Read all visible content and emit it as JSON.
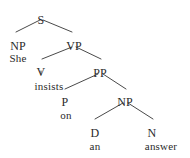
{
  "figure": {
    "kind": "constituency-syntax-tree",
    "sentence": "She insists on an answer",
    "ink_color": "#2b2b2b",
    "line_color": "#4a4a4a",
    "background_color": "#ffffff"
  },
  "nodes": {
    "s": {
      "label": "S",
      "x": 41,
      "y": 14
    },
    "np_subject": {
      "label": "NP",
      "x": 18,
      "y": 40
    },
    "vp": {
      "label": "VP",
      "x": 74,
      "y": 40
    },
    "v": {
      "label": "V",
      "x": 41,
      "y": 66
    },
    "pp": {
      "label": "PP",
      "x": 100,
      "y": 67
    },
    "p": {
      "label": "P",
      "x": 65,
      "y": 96
    },
    "np_object": {
      "label": "NP",
      "x": 125,
      "y": 96
    },
    "d": {
      "label": "D",
      "x": 95,
      "y": 127
    },
    "n": {
      "label": "N",
      "x": 152,
      "y": 127
    }
  },
  "leaves": {
    "she": {
      "label": "She",
      "x": 18,
      "y": 53
    },
    "insists": {
      "label": "insists",
      "x": 49,
      "y": 81
    },
    "on": {
      "label": "on",
      "x": 66,
      "y": 110
    },
    "an": {
      "label": "an",
      "x": 95,
      "y": 141
    },
    "answer": {
      "label": "answer",
      "x": 161,
      "y": 141
    }
  },
  "branches": [
    {
      "name": "s-to-np-subject",
      "x1": 40,
      "y1": 20,
      "x2": 16,
      "y2": 32
    },
    {
      "name": "s-to-vp",
      "x1": 43,
      "y1": 20,
      "x2": 72,
      "y2": 32
    },
    {
      "name": "vp-to-v",
      "x1": 72,
      "y1": 47,
      "x2": 42,
      "y2": 59
    },
    {
      "name": "vp-to-pp",
      "x1": 76,
      "y1": 47,
      "x2": 101,
      "y2": 59
    },
    {
      "name": "v-to-insists",
      "x1": 41,
      "y1": 71,
      "x2": 41,
      "y2": 74
    },
    {
      "name": "pp-to-p",
      "x1": 98,
      "y1": 74,
      "x2": 65,
      "y2": 89
    },
    {
      "name": "pp-to-np-object",
      "x1": 103,
      "y1": 74,
      "x2": 126,
      "y2": 89
    },
    {
      "name": "np-object-to-d",
      "x1": 123,
      "y1": 103,
      "x2": 95,
      "y2": 119
    },
    {
      "name": "np-object-to-n",
      "x1": 128,
      "y1": 103,
      "x2": 153,
      "y2": 119
    }
  ]
}
